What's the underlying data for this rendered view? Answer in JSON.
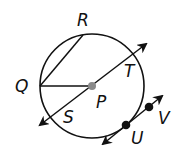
{
  "diagram": {
    "type": "circle-geometry",
    "colors": {
      "stroke": "#111111",
      "center_point": "#8a8a8a",
      "point": "#111111",
      "background": "#ffffff"
    },
    "circle": {
      "center_label": "P",
      "cx": 92,
      "cy": 86,
      "r": 52
    },
    "labels": {
      "R": "R",
      "Q": "Q",
      "P": "P",
      "T": "T",
      "S": "S",
      "U": "U",
      "V": "V"
    },
    "segments": [
      {
        "name": "chord-QR",
        "from": "Q",
        "to": "R"
      },
      {
        "name": "radius-QP",
        "from": "Q",
        "to": "P"
      }
    ],
    "lines": [
      {
        "name": "secant-ST",
        "through": [
          "S",
          "P",
          "T"
        ],
        "arrows": "both"
      },
      {
        "name": "tangent-UV",
        "through": [
          "U",
          "V"
        ],
        "arrows": "both"
      }
    ]
  }
}
